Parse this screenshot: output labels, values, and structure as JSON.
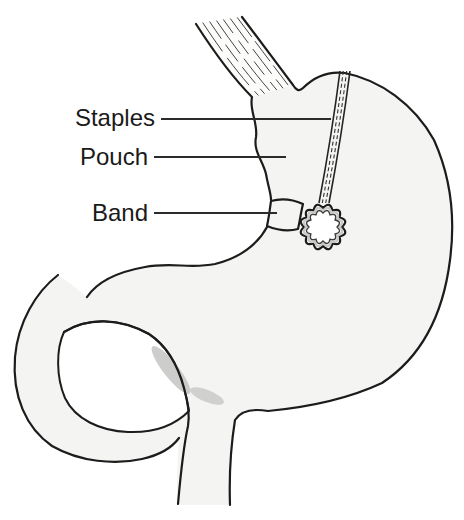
{
  "figure": {
    "labels": {
      "staples": "Staples",
      "pouch": "Pouch",
      "band": "Band"
    }
  },
  "colors": {
    "background": "#ffffff",
    "outline": "#1c1c1c",
    "organ_fill": "#f4f4f2",
    "esophagus_lumen": "#fcfcfb",
    "lumen_white": "#ffffff",
    "shadow": "#c1c1bf",
    "band_light": "#f0f0ee",
    "band_mid": "#dcdcda",
    "band_dark": "#98989a",
    "leader_line": "#2b2b2b",
    "label_text": "#1a1a1a"
  }
}
